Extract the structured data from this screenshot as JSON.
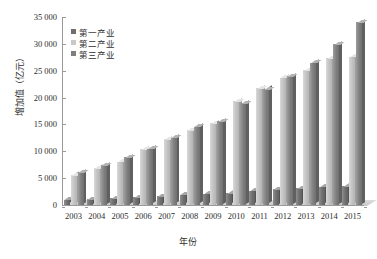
{
  "chart_data": {
    "type": "bar",
    "title": "",
    "xlabel": "年份",
    "ylabel": "增加值（亿元）",
    "ylim": [
      0,
      35000
    ],
    "ytick_values": [
      35000,
      30000,
      25000,
      20000,
      15000,
      10000,
      5000,
      0
    ],
    "ytick_labels": [
      "35 000",
      "30 000",
      "25 000",
      "20 000",
      "15 000",
      "10 000",
      "5 000",
      "0"
    ],
    "grid": false,
    "legend_position": "top-left",
    "categories": [
      "2003",
      "2004",
      "2005",
      "2006",
      "2007",
      "2008",
      "2009",
      "2010",
      "2011",
      "2012",
      "2013",
      "2014",
      "2015"
    ],
    "series": [
      {
        "name": "第一产业",
        "color": "#6f6f6f",
        "values": [
          1000,
          1100,
          1250,
          1400,
          1600,
          1950,
          2100,
          2250,
          2650,
          2900,
          3100,
          3400,
          3550
        ]
      },
      {
        "name": "第二产业",
        "color": "#c9c9c9",
        "values": [
          5600,
          6900,
          8100,
          10400,
          12200,
          13900,
          15200,
          19300,
          21700,
          23700,
          25100,
          27300,
          27600
        ]
      },
      {
        "name": "第三产业",
        "color": "#7e7e7e",
        "values": [
          6100,
          7400,
          8900,
          10450,
          12500,
          14600,
          15600,
          18900,
          21600,
          24000,
          26500,
          29900,
          34000
        ]
      }
    ]
  },
  "legend": {
    "items": [
      {
        "label": "第一产业"
      },
      {
        "label": "第二产业"
      },
      {
        "label": "第三产业"
      }
    ]
  }
}
